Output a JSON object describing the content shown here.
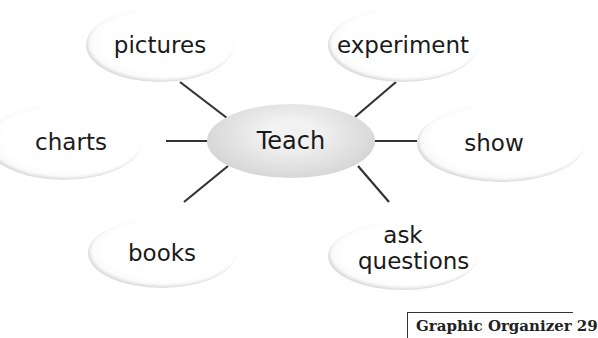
{
  "diagram": {
    "type": "web graphic organizer",
    "center": "Teach",
    "nodes": [
      {
        "id": "pictures",
        "label": "pictures"
      },
      {
        "id": "experiment",
        "label": "experiment"
      },
      {
        "id": "charts",
        "label": "charts"
      },
      {
        "id": "show",
        "label": "show"
      },
      {
        "id": "books",
        "label": "books"
      },
      {
        "id": "ask-questions",
        "label": "ask questions"
      }
    ]
  },
  "footer": {
    "label": "Graphic  Organizer 29"
  }
}
